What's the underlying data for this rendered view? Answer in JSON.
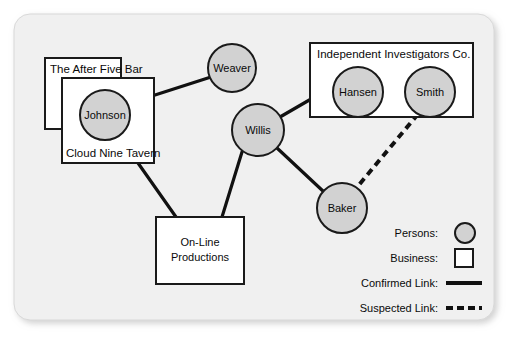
{
  "frame": {
    "background_color": "#f0f0f0",
    "border_color": "#d8d8d8"
  },
  "style": {
    "person_fill": "#d2d2d2",
    "person_stroke": "#1a1a1a",
    "business_fill": "#ffffff",
    "business_stroke": "#1a1a1a",
    "link_color": "#111111",
    "text_color": "#0a0a0a"
  },
  "persons": [
    {
      "id": "johnson",
      "label": "Johnson",
      "cx": 105,
      "cy": 115,
      "r": 25
    },
    {
      "id": "weaver",
      "label": "Weaver",
      "cx": 232,
      "cy": 68,
      "r": 24
    },
    {
      "id": "willis",
      "label": "Willis",
      "cx": 258,
      "cy": 130,
      "r": 26
    },
    {
      "id": "hansen",
      "label": "Hansen",
      "cx": 358,
      "cy": 92,
      "r": 25
    },
    {
      "id": "smith",
      "label": "Smith",
      "cx": 430,
      "cy": 92,
      "r": 25
    },
    {
      "id": "baker",
      "label": "Baker",
      "cx": 342,
      "cy": 208,
      "r": 25
    }
  ],
  "businesses": [
    {
      "id": "after-five-bar",
      "label": "The After Five Bar",
      "x": 45,
      "y": 58,
      "w": 76,
      "h": 71,
      "label_x": 50,
      "label_y": 73,
      "label_align": "left"
    },
    {
      "id": "cloud-nine-tavern",
      "label": "Cloud Nine Tavern",
      "x": 62,
      "y": 78,
      "w": 92,
      "h": 85,
      "label_x": 66,
      "label_y": 157,
      "label_align": "left"
    },
    {
      "id": "on-line-productions",
      "label_line1": "On-Line",
      "label_line2": "Productions",
      "x": 156,
      "y": 217,
      "w": 88,
      "h": 67,
      "label_x": 200,
      "label_y1": 246,
      "label_y2": 261,
      "label_align": "center"
    },
    {
      "id": "independent-investigators",
      "label": "Independent Investigators Co.",
      "x": 310,
      "y": 43,
      "w": 163,
      "h": 74,
      "label_x": 317,
      "label_y": 58,
      "label_align": "left"
    }
  ],
  "links": [
    {
      "id": "johnson-weaver",
      "type": "confirmed",
      "from": "johnson",
      "to": "weaver",
      "x1": 127,
      "y1": 104,
      "x2": 211,
      "y2": 77
    },
    {
      "id": "johnson-online",
      "type": "confirmed",
      "from": "johnson",
      "to": "on-line-productions",
      "x1": 119,
      "y1": 136,
      "x2": 176,
      "y2": 217
    },
    {
      "id": "willis-online",
      "type": "confirmed",
      "from": "willis",
      "to": "on-line-productions",
      "x1": 242,
      "y1": 152,
      "x2": 222,
      "y2": 217
    },
    {
      "id": "willis-hansen",
      "type": "confirmed",
      "from": "willis",
      "to": "hansen",
      "x1": 280,
      "y1": 117,
      "x2": 337,
      "y2": 84
    },
    {
      "id": "willis-baker",
      "type": "confirmed",
      "from": "willis",
      "to": "baker",
      "x1": 277,
      "y1": 148,
      "x2": 324,
      "y2": 192
    },
    {
      "id": "hansen-smith",
      "type": "confirmed",
      "from": "hansen",
      "to": "smith",
      "x1": 383,
      "y1": 92,
      "x2": 405,
      "y2": 92
    },
    {
      "id": "smith-baker",
      "type": "suspected",
      "from": "smith",
      "to": "baker",
      "x1": 418,
      "y1": 114,
      "x2": 358,
      "y2": 186
    }
  ],
  "legend": {
    "items": [
      {
        "id": "persons",
        "label": "Persons:",
        "symbol": "circle-icon",
        "label_x": 438,
        "label_y": 237,
        "sym_x": 455,
        "sym_y": 233
      },
      {
        "id": "business",
        "label": "Business:",
        "symbol": "square-icon",
        "label_x": 438,
        "label_y": 262,
        "sym_x": 455,
        "sym_y": 258
      },
      {
        "id": "confirmed-link",
        "label": "Confirmed Link:",
        "symbol": "solid-line-icon",
        "label_x": 438,
        "label_y": 287,
        "sym_x": 446,
        "sym_y": 283
      },
      {
        "id": "suspected-link",
        "label": "Suspected Link:",
        "symbol": "dashed-line-icon",
        "label_x": 438,
        "label_y": 312,
        "sym_x": 446,
        "sym_y": 308
      }
    ]
  }
}
